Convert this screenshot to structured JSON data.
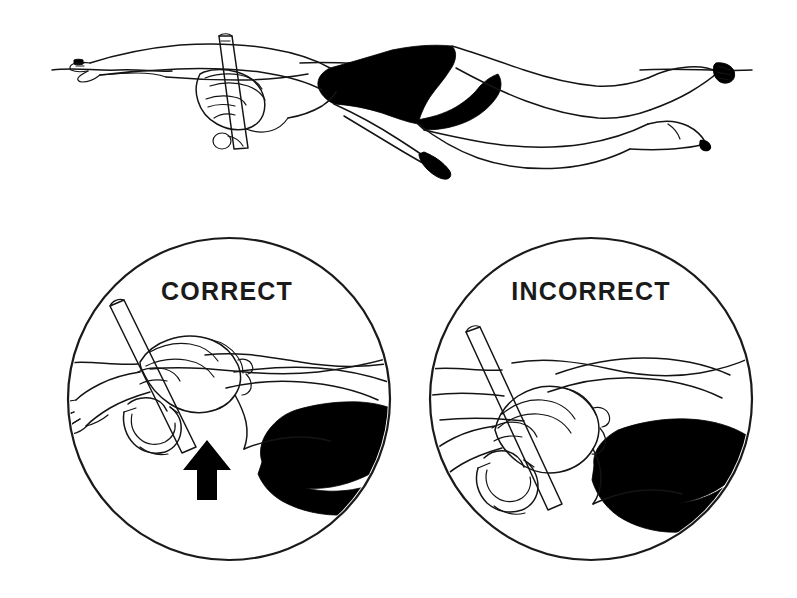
{
  "document": {
    "kind": "instructional-illustration",
    "subject": "Swimming snorkel head position technique",
    "background_color": "#ffffff",
    "ink_color": "#141414",
    "fill_color": "#000000",
    "width": 797,
    "height": 598
  },
  "top_figure": {
    "name": "full-body-swimmer",
    "description": "Side view of a swimmer floating prone at the surface wearing a front-mounted snorkel and a dark one-piece swimsuit, arms extended forward past the head, legs trailing behind with toes pointed.",
    "waterline_label": "",
    "parts": [
      "extended-lead-arm",
      "trailing-arm",
      "head-with-snorkel",
      "snorkel-tube",
      "snorkel-mask-frame",
      "black-swimsuit",
      "upper-leg",
      "lower-leg",
      "pointed-foot",
      "waterline"
    ]
  },
  "panels": [
    {
      "id": "correct",
      "caption": "CORRECT",
      "caption_x": 227,
      "caption_y": 293,
      "center_x": 229,
      "center_y": 399,
      "radius": 161,
      "has_arrow": true,
      "arrow": {
        "name": "upward-arrow",
        "direction": "up",
        "color": "#000000",
        "tip_x": 207,
        "tip_y": 440
      },
      "description": "Head held high with the waterline at the hairline; snorkel tube angled forward and clear of the water."
    },
    {
      "id": "incorrect",
      "caption": "INCORRECT",
      "caption_x": 591,
      "caption_y": 293,
      "center_x": 591,
      "center_y": 399,
      "radius": 161,
      "has_arrow": false,
      "arrow": null,
      "description": "Head dropped too low so the face and snorkel mouthpiece sink below the waterline."
    }
  ]
}
